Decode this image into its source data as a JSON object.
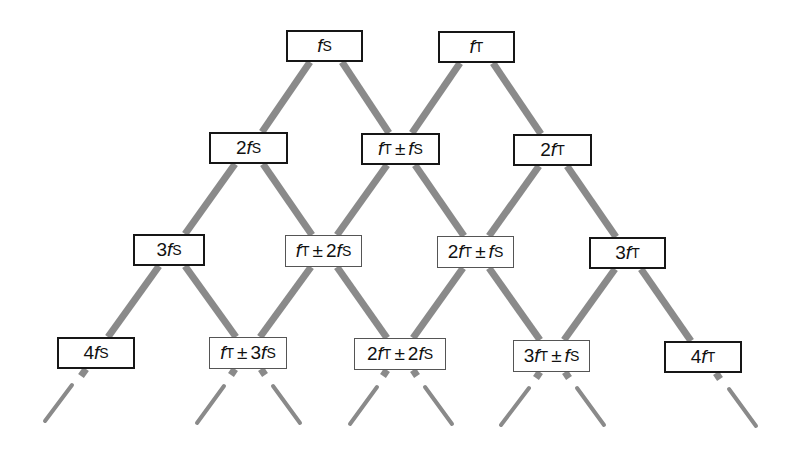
{
  "diagram": {
    "colors": {
      "line": "#8a8a8a",
      "stub": "#8a8a8a",
      "box_border": "#161616",
      "background": "#ffffff"
    },
    "nodes": [
      {
        "id": "fS",
        "row": 0,
        "parts": [
          {
            "t": "f",
            "i": true
          },
          {
            "sub": "S"
          }
        ],
        "label": "fS",
        "box": [
          286,
          30,
          77,
          32
        ],
        "style": "thick"
      },
      {
        "id": "fT",
        "row": 0,
        "parts": [
          {
            "t": "f",
            "i": true
          },
          {
            "sub": "T"
          }
        ],
        "label": "fT",
        "box": [
          438,
          31,
          77,
          32
        ],
        "style": "thick"
      },
      {
        "id": "2fS",
        "row": 1,
        "label": "2fS",
        "box": [
          209,
          132,
          79,
          32
        ],
        "style": "thick"
      },
      {
        "id": "fT+-fS",
        "row": 1,
        "label": "fT ± fS",
        "box": [
          361,
          133,
          79,
          32
        ],
        "style": "thick"
      },
      {
        "id": "2fT",
        "row": 1,
        "label": "2fT",
        "box": [
          513,
          134,
          79,
          32
        ],
        "style": "thick"
      },
      {
        "id": "3fS",
        "row": 2,
        "label": "3fS",
        "box": [
          133,
          234,
          72,
          32
        ],
        "style": "thick"
      },
      {
        "id": "fT+-2fS",
        "row": 2,
        "label": "fT ± 2fS",
        "box": [
          285,
          235,
          77,
          32
        ],
        "style": "thin"
      },
      {
        "id": "2fT+-fS",
        "row": 2,
        "label": "2fT ± fS",
        "box": [
          437,
          236,
          77,
          32
        ],
        "style": "thin"
      },
      {
        "id": "3fT",
        "row": 2,
        "label": "3fT",
        "box": [
          589,
          237,
          77,
          32
        ],
        "style": "thick"
      },
      {
        "id": "4fS",
        "row": 3,
        "label": "4fS",
        "box": [
          57,
          337,
          78,
          32
        ],
        "style": "thick"
      },
      {
        "id": "fT+-3fS",
        "row": 3,
        "label": "fT ± 3fS",
        "box": [
          209,
          337,
          78,
          32
        ],
        "style": "thin"
      },
      {
        "id": "2fT+-2fS",
        "row": 3,
        "label": "2fT ± 2fS",
        "box": [
          354,
          338,
          92,
          32
        ],
        "style": "thin"
      },
      {
        "id": "3fT+-fS",
        "row": 3,
        "label": "3fT ± fS",
        "box": [
          513,
          340,
          77,
          32
        ],
        "style": "thin"
      },
      {
        "id": "4fT",
        "row": 3,
        "label": "4fT",
        "box": [
          664,
          341,
          78,
          32
        ],
        "style": "thick"
      }
    ],
    "edges": [
      {
        "from": "fS",
        "to": "2fS"
      },
      {
        "from": "fS",
        "to": "fT+-fS"
      },
      {
        "from": "fT",
        "to": "fT+-fS"
      },
      {
        "from": "fT",
        "to": "2fT"
      },
      {
        "from": "2fS",
        "to": "3fS"
      },
      {
        "from": "2fS",
        "to": "fT+-2fS"
      },
      {
        "from": "fT+-fS",
        "to": "fT+-2fS"
      },
      {
        "from": "fT+-fS",
        "to": "2fT+-fS"
      },
      {
        "from": "2fT",
        "to": "2fT+-fS"
      },
      {
        "from": "2fT",
        "to": "3fT"
      },
      {
        "from": "3fS",
        "to": "4fS"
      },
      {
        "from": "3fS",
        "to": "fT+-3fS"
      },
      {
        "from": "fT+-2fS",
        "to": "fT+-3fS"
      },
      {
        "from": "fT+-2fS",
        "to": "2fT+-2fS"
      },
      {
        "from": "2fT+-fS",
        "to": "2fT+-2fS"
      },
      {
        "from": "2fT+-fS",
        "to": "3fT+-fS"
      },
      {
        "from": "3fT",
        "to": "3fT+-fS"
      },
      {
        "from": "3fT",
        "to": "4fT"
      }
    ],
    "continuation_stubs": [
      {
        "below": "4fS",
        "direction": "left"
      },
      {
        "below": "fT+-3fS",
        "direction": "left"
      },
      {
        "below": "fT+-3fS",
        "direction": "right"
      },
      {
        "below": "2fT+-2fS",
        "direction": "left"
      },
      {
        "below": "2fT+-2fS",
        "direction": "right"
      },
      {
        "below": "3fT+-fS",
        "direction": "left"
      },
      {
        "below": "3fT+-fS",
        "direction": "right"
      },
      {
        "below": "4fT",
        "direction": "right"
      }
    ]
  }
}
